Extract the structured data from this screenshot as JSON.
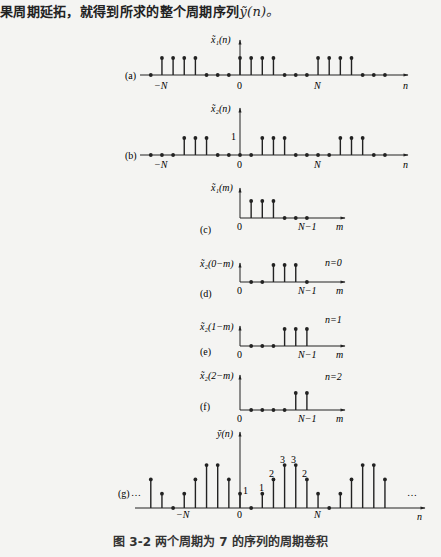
{
  "intro_text": "果周期延拓，就得到所求的整个周期序列",
  "intro_symbol": "ỹ(n)。",
  "caption": "图 3-2   两个周期为 7 的序列的周期卷积",
  "chart_data": [
    {
      "type": "stem",
      "panel": "(a)",
      "ylabel": "x̃1(n)",
      "xlabel": "n",
      "period": 7,
      "n": [
        -8,
        -7,
        -6,
        -5,
        -4,
        -3,
        -2,
        -1,
        0,
        1,
        2,
        3,
        4,
        5,
        6,
        7,
        8,
        9,
        10,
        11,
        12,
        13
      ],
      "values": [
        0,
        1,
        1,
        1,
        1,
        0,
        0,
        0,
        1,
        1,
        1,
        1,
        0,
        0,
        0,
        1,
        1,
        1,
        1,
        0,
        0,
        0
      ],
      "ticks": [
        "-N",
        "0",
        "N"
      ]
    },
    {
      "type": "stem",
      "panel": "(b)",
      "ylabel": "x̃2(n)",
      "xlabel": "n",
      "period": 7,
      "y_tick": "1",
      "n": [
        -8,
        -7,
        -6,
        -5,
        -4,
        -3,
        -2,
        -1,
        0,
        1,
        2,
        3,
        4,
        5,
        6,
        7,
        8,
        9,
        10,
        11,
        12,
        13
      ],
      "values": [
        0,
        0,
        0,
        1,
        1,
        1,
        0,
        0,
        0,
        0,
        1,
        1,
        1,
        0,
        0,
        0,
        0,
        1,
        1,
        1,
        0,
        0
      ],
      "ticks": [
        "-N",
        "0",
        "N"
      ]
    },
    {
      "type": "stem",
      "panel": "(c)",
      "ylabel": "x̃1(m)",
      "xlabel": "m",
      "m": [
        0,
        1,
        2,
        3,
        4,
        5,
        6
      ],
      "values": [
        1,
        1,
        1,
        1,
        0,
        0,
        0
      ],
      "ticks": [
        "0",
        "N-1"
      ]
    },
    {
      "type": "stem",
      "panel": "(d)",
      "ylabel": "x̃2(0-m)",
      "xlabel": "m",
      "note": "n=0",
      "m": [
        0,
        1,
        2,
        3,
        4,
        5,
        6
      ],
      "values": [
        0,
        0,
        0,
        1,
        1,
        1,
        0
      ],
      "ticks": [
        "0",
        "N-1"
      ]
    },
    {
      "type": "stem",
      "panel": "(e)",
      "ylabel": "x̃2(1-m)",
      "xlabel": "m",
      "note": "n=1",
      "m": [
        0,
        1,
        2,
        3,
        4,
        5,
        6
      ],
      "values": [
        0,
        0,
        0,
        0,
        1,
        1,
        1
      ],
      "ticks": [
        "0",
        "N-1"
      ]
    },
    {
      "type": "stem",
      "panel": "(f)",
      "ylabel": "x̃2(2-m)",
      "xlabel": "m",
      "note": "n=2",
      "m": [
        0,
        1,
        2,
        3,
        4,
        5,
        6
      ],
      "values": [
        1,
        0,
        0,
        0,
        0,
        1,
        1
      ],
      "ticks": [
        "0",
        "N-1"
      ]
    },
    {
      "type": "stem",
      "panel": "(g)",
      "ylabel": "ỹ(n)",
      "xlabel": "n",
      "period": 7,
      "n": [
        -8,
        -7,
        -6,
        -5,
        -4,
        -3,
        -2,
        -1,
        0,
        1,
        2,
        3,
        4,
        5,
        6,
        7,
        8,
        9,
        10,
        11,
        12,
        13
      ],
      "values": [
        2,
        1,
        0,
        1,
        2,
        3,
        3,
        2,
        1,
        0,
        1,
        2,
        3,
        3,
        2,
        1,
        0,
        1,
        2,
        3,
        3,
        2
      ],
      "data_labels": {
        "0": "1",
        "2": "1",
        "3": "2",
        "4": "3",
        "5": "3",
        "6": "2"
      },
      "ticks": [
        "-N",
        "0",
        "N"
      ],
      "ellipsis": "…"
    }
  ],
  "panels": {
    "a": {
      "label": "(a)",
      "ylabel": "x̃₁(n)",
      "tick_neg": "−N",
      "tick_zero": "0",
      "tick_pos": "N",
      "axis": "n"
    },
    "b": {
      "label": "(b)",
      "ylabel": "x̃₂(n)",
      "ytick": "1",
      "tick_neg": "−N",
      "tick_zero": "0",
      "tick_pos": "N",
      "axis": "n"
    },
    "c": {
      "label": "(c)",
      "ylabel": "x̃₁(m)",
      "tick_zero": "0",
      "tick_end": "N−1",
      "axis": "m"
    },
    "d": {
      "label": "(d)",
      "ylabel": "x̃₂(0−m)",
      "note": "n=0",
      "tick_zero": "0",
      "tick_end": "N−1",
      "axis": "m"
    },
    "e": {
      "label": "(e)",
      "ylabel": "x̃₂(1−m)",
      "note": "n=1",
      "tick_zero": "0",
      "tick_end": "N−1",
      "axis": "m"
    },
    "f": {
      "label": "(f)",
      "ylabel": "x̃₂(2−m)",
      "note": "n=2",
      "tick_zero": "0",
      "tick_end": "N−1",
      "axis": "m"
    },
    "g": {
      "label": "(g)",
      "ylabel": "ỹ(n)",
      "tick_neg": "−N",
      "tick_zero": "0",
      "tick_pos": "N",
      "axis": "n",
      "ellipsis_left": "…",
      "ellipsis_right": "…",
      "vlabels": [
        "1",
        "1",
        "2",
        "3",
        "3",
        "2"
      ]
    }
  }
}
